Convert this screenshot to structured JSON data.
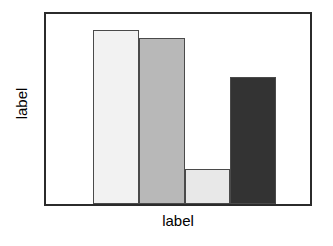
{
  "chart_data": {
    "type": "bar",
    "title": "",
    "subtitle": "",
    "xlabel": "label",
    "ylabel": "label",
    "categories": [
      "",
      "",
      "",
      ""
    ],
    "values": [
      0.91,
      0.87,
      0.19,
      0.67
    ],
    "ylim": [
      0,
      1
    ],
    "xlim": [
      0,
      1
    ],
    "grid": false,
    "legend": null,
    "tick_labels": {
      "x": [],
      "y": []
    },
    "annotations": [],
    "bars": [
      {
        "name": "bar-1",
        "value": 0.91,
        "fill": "#f2f2f2",
        "edge": "#4a4a4a"
      },
      {
        "name": "bar-2",
        "value": 0.87,
        "fill": "#b8b8b8",
        "edge": "#4a4a4a"
      },
      {
        "name": "bar-3",
        "value": 0.19,
        "fill": "#e8e8e8",
        "edge": "#4a4a4a"
      },
      {
        "name": "bar-4",
        "value": 0.67,
        "fill": "#333333",
        "edge": "#4a4a4a"
      }
    ],
    "geometry": {
      "bar_left_pct": [
        17.9,
        35.2,
        52.8,
        69.8
      ],
      "bar_width_pct": [
        17.2,
        17.6,
        17.0,
        17.4
      ],
      "bar_height_pct": [
        91.7,
        87.6,
        18.6,
        66.8
      ]
    },
    "colors": {
      "frame": "#2b2b2b",
      "background": "#ffffff",
      "text": "#000000"
    }
  }
}
